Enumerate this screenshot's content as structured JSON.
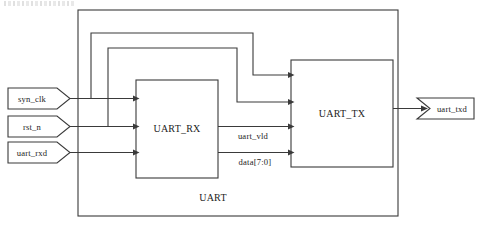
{
  "diagram": {
    "module_label": "UART",
    "stroke_color": "#3a3a3a",
    "background_color": "#ffffff",
    "blocks": [
      {
        "id": "rx",
        "label": "UART_RX"
      },
      {
        "id": "tx",
        "label": "UART_TX"
      }
    ],
    "input_ports": [
      {
        "id": "clk",
        "label": "syn_clk"
      },
      {
        "id": "rst",
        "label": "rst_n"
      },
      {
        "id": "rxd",
        "label": "uart_rxd"
      }
    ],
    "output_ports": [
      {
        "id": "txd",
        "label": "uart_txd"
      }
    ],
    "internal_signals": [
      {
        "id": "vld",
        "label": "uart_vld"
      },
      {
        "id": "data",
        "label": "data[7:0]"
      }
    ]
  }
}
